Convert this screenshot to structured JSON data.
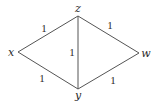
{
  "graph": {
    "nodes": [
      {
        "id": "x",
        "label": "x",
        "vx": 18,
        "vy": 52,
        "lx": 11,
        "ly": 56
      },
      {
        "id": "z",
        "label": "z",
        "vx": 78,
        "vy": 16,
        "lx": 78,
        "ly": 12
      },
      {
        "id": "w",
        "label": "w",
        "vx": 139,
        "vy": 53,
        "lx": 146,
        "ly": 57
      },
      {
        "id": "y",
        "label": "y",
        "vx": 78,
        "vy": 89,
        "lx": 78,
        "ly": 99
      }
    ],
    "edges": [
      {
        "from": "x",
        "to": "z",
        "weight": "1",
        "lx": 44,
        "ly": 32
      },
      {
        "from": "z",
        "to": "w",
        "weight": "1",
        "lx": 110,
        "ly": 29
      },
      {
        "from": "z",
        "to": "y",
        "weight": "1",
        "lx": 72,
        "ly": 56
      },
      {
        "from": "x",
        "to": "y",
        "weight": "1",
        "lx": 42,
        "ly": 82
      },
      {
        "from": "y",
        "to": "w",
        "weight": "1",
        "lx": 113,
        "ly": 84
      }
    ]
  },
  "colors": {
    "edge": "#555555",
    "text": "#2a2a2a",
    "background": "#ffffff"
  }
}
